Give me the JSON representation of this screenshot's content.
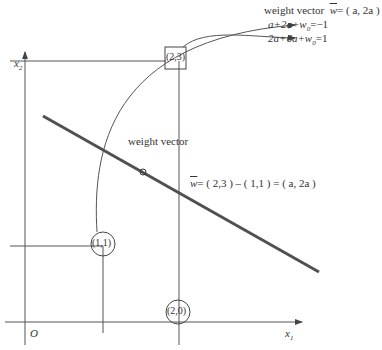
{
  "diagram": {
    "axes": {
      "x_label": "x",
      "x_sub": "1",
      "y_label": "x",
      "y_sub": "2",
      "origin_label": "O"
    },
    "points": [
      {
        "label": "(2,3)",
        "shape": "square"
      },
      {
        "label": "(1,1)",
        "shape": "circle"
      },
      {
        "label": "(2,0)",
        "shape": "circle"
      }
    ],
    "midpoint_marker": "O",
    "mid_label": "weight vector",
    "vector_equation": "⃗w= ( 2,3 ) – ( 1,1 ) = ( a, 2a )",
    "vector_eq_parts": {
      "w": "w",
      "rest": "= ( 2,3 ) – ( 1,1 ) = ( a, 2a )"
    },
    "top_annotation": {
      "title": "weight vector",
      "w": "w",
      "title_rest": "= ( a, 2a )",
      "equation1": "a+2a+w",
      "equation1_sub": "0",
      "equation1_rest": "=−1",
      "equation2": "2a+6a+w",
      "equation2_sub": "0",
      "equation2_rest": "=1"
    },
    "colors": {
      "line": "#555555",
      "thick_line": "#505050",
      "text": "#333333"
    }
  }
}
